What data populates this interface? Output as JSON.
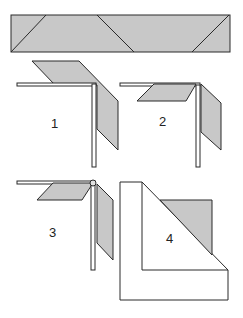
{
  "diagram": {
    "colors": {
      "fill": "#c8c8c8",
      "stroke": "#2a2a2a",
      "background": "#ffffff"
    },
    "strip": {
      "description": "folding strip with diagonal crease lines"
    },
    "steps": [
      {
        "label": "1"
      },
      {
        "label": "2"
      },
      {
        "label": "3"
      },
      {
        "label": "4"
      }
    ]
  }
}
